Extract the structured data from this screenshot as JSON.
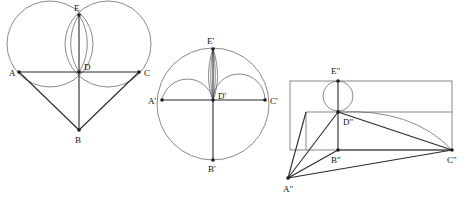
{
  "figure": {
    "background_color": "#ffffff",
    "line_color_light": "#6b6b72",
    "line_color_dark": "#2a2a2e",
    "vertex_color": "#1d1d20",
    "width": 470,
    "height": 205
  },
  "panels": [
    {
      "id": "panel-1",
      "name": "heart-figure",
      "description": "Heart shape formed by two intersecting circles above a V",
      "labels": [
        {
          "key": "A",
          "text": "A",
          "x": 9,
          "y": 76
        },
        {
          "key": "C",
          "text": "C",
          "x": 144,
          "y": 76
        },
        {
          "key": "D",
          "text": "D",
          "x": 84,
          "y": 70
        },
        {
          "key": "E",
          "text": "E",
          "x": 74,
          "y": 11
        },
        {
          "key": "B",
          "text": "B",
          "x": 75,
          "y": 143
        }
      ],
      "points": [
        {
          "key": "A",
          "x": 19,
          "y": 72
        },
        {
          "key": "C",
          "x": 139,
          "y": 72
        },
        {
          "key": "D",
          "x": 79,
          "y": 72
        },
        {
          "key": "E",
          "x": 79,
          "y": 15
        },
        {
          "key": "B",
          "x": 79,
          "y": 130
        }
      ],
      "circles": [
        {
          "key": "left-circle",
          "cx": 50,
          "cy": 44,
          "r": 43
        },
        {
          "key": "right-circle",
          "cx": 108,
          "cy": 44,
          "r": 43
        }
      ],
      "lens": {
        "key": "vesica-lens",
        "top_x": 79,
        "top_y": 15,
        "bottom_x": 79,
        "bottom_y": 72,
        "bulge": 9
      }
    },
    {
      "id": "panel-2",
      "name": "circle-figure",
      "description": "Large circle with two semicircular arcs and a narrow lens",
      "labels": [
        {
          "key": "A'",
          "text": "A'",
          "x": 148,
          "y": 104
        },
        {
          "key": "C'",
          "text": "C'",
          "x": 270,
          "y": 104
        },
        {
          "key": "D'",
          "text": "D'",
          "x": 218,
          "y": 99
        },
        {
          "key": "E'",
          "text": "E'",
          "x": 207,
          "y": 44
        },
        {
          "key": "B'",
          "text": "B'",
          "x": 208,
          "y": 172
        }
      ],
      "points": [
        {
          "key": "A'",
          "x": 162,
          "y": 100
        },
        {
          "key": "C'",
          "x": 265,
          "y": 100
        },
        {
          "key": "D'",
          "x": 213,
          "y": 100
        },
        {
          "key": "E'",
          "x": 213,
          "y": 49
        },
        {
          "key": "B'",
          "x": 213,
          "y": 160
        }
      ],
      "circles": [
        {
          "key": "outer-circle",
          "cx": 213,
          "cy": 104,
          "r": 56
        }
      ],
      "arcs": [
        {
          "key": "left-arc",
          "cx": 188,
          "cy": 100,
          "r": 26
        },
        {
          "key": "right-arc",
          "cx": 239,
          "cy": 100,
          "r": 26
        }
      ],
      "lens": {
        "key": "narrow-lens",
        "top_x": 213,
        "top_y": 49,
        "bottom_x": 213,
        "bottom_y": 100,
        "bulge": 5
      }
    },
    {
      "id": "panel-3",
      "name": "rectangle-figure",
      "description": "Rectangle with a small circle at top, inner polygon and a sagging curve",
      "labels": [
        {
          "key": "A\"",
          "text": "A\"",
          "x": 283,
          "y": 192
        },
        {
          "key": "B\"",
          "text": "B\"",
          "x": 331,
          "y": 163
        },
        {
          "key": "C\"",
          "text": "C\"",
          "x": 447,
          "y": 163
        },
        {
          "key": "D\"",
          "text": "D\"",
          "x": 343,
          "y": 125
        },
        {
          "key": "E\"",
          "text": "E\"",
          "x": 331,
          "y": 74
        }
      ],
      "points": [
        {
          "key": "A\"",
          "x": 288,
          "y": 178
        },
        {
          "key": "B\"",
          "x": 338,
          "y": 150
        },
        {
          "key": "C\"",
          "x": 452,
          "y": 150
        },
        {
          "key": "D\"",
          "x": 338,
          "y": 112
        },
        {
          "key": "E\"",
          "x": 338,
          "y": 81
        }
      ],
      "rectangle": {
        "key": "outer-rect",
        "x": 290,
        "y": 81,
        "width": 162,
        "height": 69
      },
      "inner_rect": {
        "key": "inner-rect",
        "x": 306,
        "y": 112,
        "width": 146,
        "height": 38
      },
      "circle": {
        "key": "small-circle",
        "cx": 338,
        "cy": 96,
        "r": 15
      },
      "curve": {
        "key": "sagging-curve",
        "from_x": 338,
        "from_y": 112,
        "to_x": 452,
        "to_y": 150,
        "ctrl_x": 410,
        "ctrl_y": 110
      }
    }
  ]
}
